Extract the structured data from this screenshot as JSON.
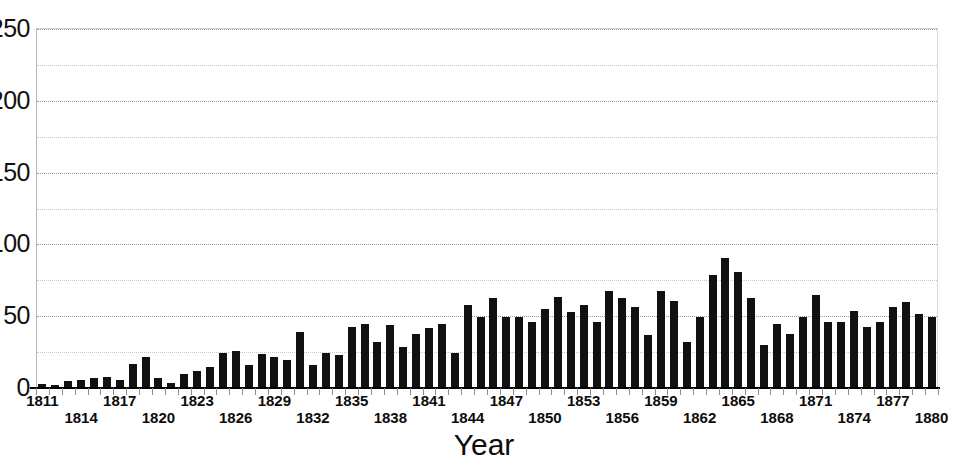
{
  "chart_data": {
    "type": "bar",
    "title": "",
    "subtitle": "",
    "xlabel": "Year",
    "ylabel": "",
    "grid": true,
    "legend": false,
    "legend_position": "none",
    "bar_color": "#111111",
    "gridline_color": "#c8c8c8",
    "xlim": [
      1811,
      1880
    ],
    "ylim": [
      0,
      250
    ],
    "y_major_step": 50,
    "y_minor_step": 25,
    "y_tick_labels": [
      "250",
      "200",
      "150",
      "100",
      "50",
      "0"
    ],
    "y_tick_values": [
      250,
      200,
      150,
      100,
      50,
      0
    ],
    "x_tick_labels_top": [
      "1811",
      "1817",
      "1823",
      "1829",
      "1835",
      "1841",
      "1847",
      "1853",
      "1859",
      "1865",
      "1871",
      "1877"
    ],
    "x_tick_labels_bottom": [
      "1814",
      "1820",
      "1826",
      "1832",
      "1838",
      "1844",
      "1850",
      "1856",
      "1862",
      "1868",
      "1874",
      "1880"
    ],
    "categories": [
      1811,
      1812,
      1813,
      1814,
      1815,
      1816,
      1817,
      1818,
      1819,
      1820,
      1821,
      1822,
      1823,
      1824,
      1825,
      1826,
      1827,
      1828,
      1829,
      1830,
      1831,
      1832,
      1833,
      1834,
      1835,
      1836,
      1837,
      1838,
      1839,
      1840,
      1841,
      1842,
      1843,
      1844,
      1845,
      1846,
      1847,
      1848,
      1849,
      1850,
      1851,
      1852,
      1853,
      1854,
      1855,
      1856,
      1857,
      1858,
      1859,
      1860,
      1861,
      1862,
      1863,
      1864,
      1865,
      1866,
      1867,
      1868,
      1869,
      1870,
      1871,
      1872,
      1873,
      1874,
      1875,
      1876,
      1877,
      1878,
      1879,
      1880
    ],
    "values": [
      2,
      1,
      4,
      5,
      6,
      7,
      5,
      16,
      21,
      6,
      3,
      9,
      11,
      14,
      24,
      25,
      15,
      23,
      21,
      19,
      38,
      15,
      24,
      22,
      42,
      44,
      31,
      43,
      28,
      37,
      41,
      44,
      24,
      57,
      49,
      62,
      49,
      49,
      45,
      54,
      63,
      52,
      57,
      45,
      67,
      62,
      56,
      36,
      67,
      60,
      31,
      49,
      78,
      90,
      80,
      62,
      29,
      44,
      37,
      49,
      64,
      45,
      45,
      53,
      42,
      45,
      56,
      59,
      51,
      49
    ],
    "values_units": "count",
    "annotations": []
  },
  "axis_geometry": {
    "baseline_y_px": 387,
    "top_y_px": 28,
    "plot_left_px": 36,
    "plot_right_px": 938,
    "bar_width_px": 8,
    "bar_pitch_px": 12.9
  }
}
